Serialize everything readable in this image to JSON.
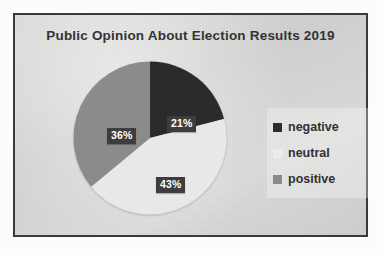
{
  "chart_data": {
    "type": "pie",
    "title": "Public Opinion About Election Results 2019",
    "categories": [
      "negative",
      "neutral",
      "positive"
    ],
    "values": [
      21,
      43,
      36
    ],
    "labels": [
      "21%",
      "43%",
      "36%"
    ],
    "colors": [
      "#2b2b2b",
      "#e8e8e6",
      "#8b8b8b"
    ],
    "units": "percent",
    "start_angle_deg": 0,
    "direction": "clockwise",
    "legend_position": "right",
    "grid": false,
    "xlabel": "",
    "ylabel": ""
  },
  "title": {
    "text": "Public Opinion About Election Results 2019"
  },
  "slice_labels": {
    "negative": "21%",
    "neutral": "43%",
    "positive": "36%"
  },
  "legend": {
    "items": [
      {
        "label": "negative",
        "color": "#2b2b2b"
      },
      {
        "label": "neutral",
        "color": "#ececeb"
      },
      {
        "label": "positive",
        "color": "#8b8b8b"
      }
    ]
  },
  "theme": {
    "plot_background": "#d4d4d2",
    "page_background": "#fcfcfb",
    "border_color": "#3a3a3a",
    "title_color": "#333335",
    "label_box_color": "#3d3d3d",
    "label_text_color": "#ffffff"
  }
}
